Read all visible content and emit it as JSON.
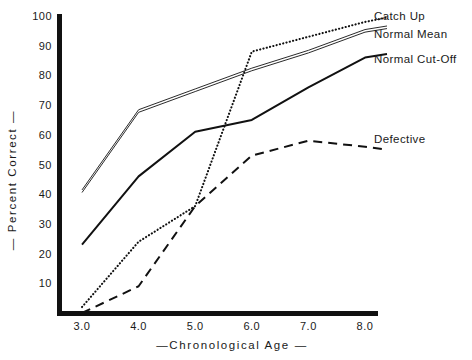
{
  "chart_data": {
    "type": "line",
    "title": "",
    "xlabel": "—Chronological Age —",
    "ylabel": "— Percent Correct —",
    "xlim": [
      2.6,
      8.2
    ],
    "ylim": [
      0,
      100
    ],
    "grid": false,
    "legend_position": "right-inline",
    "x_ticks": [
      "3.0",
      "4.0",
      "5.0",
      "6.0",
      "7.0",
      "8.0"
    ],
    "x_tick_values": [
      3.0,
      4.0,
      5.0,
      6.0,
      7.0,
      8.0
    ],
    "y_ticks": [
      "10",
      "20",
      "30",
      "40",
      "50",
      "60",
      "70",
      "80",
      "90",
      "100"
    ],
    "y_tick_values": [
      10,
      20,
      30,
      40,
      50,
      60,
      70,
      80,
      90,
      100
    ],
    "x": [
      3.0,
      4.0,
      5.0,
      6.0,
      7.0,
      8.0
    ],
    "series": [
      {
        "name": "Catch Up",
        "style": "dotted",
        "values": [
          2,
          24,
          36,
          88,
          93,
          98
        ]
      },
      {
        "name": "Normal Mean",
        "style": "double-line",
        "values": [
          41,
          68,
          75,
          82,
          88,
          95
        ]
      },
      {
        "name": "Normal Cut-Off",
        "style": "solid",
        "values": [
          23,
          46,
          61,
          65,
          76,
          86
        ]
      },
      {
        "name": "Defective",
        "style": "dashed",
        "values": [
          0,
          9,
          36,
          53,
          58,
          56
        ]
      }
    ]
  },
  "labels": {
    "catch_up": "Catch Up",
    "normal_mean": "Normal Mean",
    "normal_cut_off": "Normal Cut-Off",
    "defective": "Defective"
  },
  "axis": {
    "x_title": "—Chronological Age —",
    "y_title": "— Percent Correct —",
    "x_ticks": [
      "3.0",
      "4.0",
      "5.0",
      "6.0",
      "7.0",
      "8.0"
    ],
    "y_ticks": [
      "100",
      "90",
      "80",
      "70",
      "60",
      "50",
      "40",
      "30",
      "20",
      "10"
    ]
  },
  "colors": {
    "axis": "#111111",
    "ink": "#1a1a1a",
    "background": "#ffffff"
  }
}
